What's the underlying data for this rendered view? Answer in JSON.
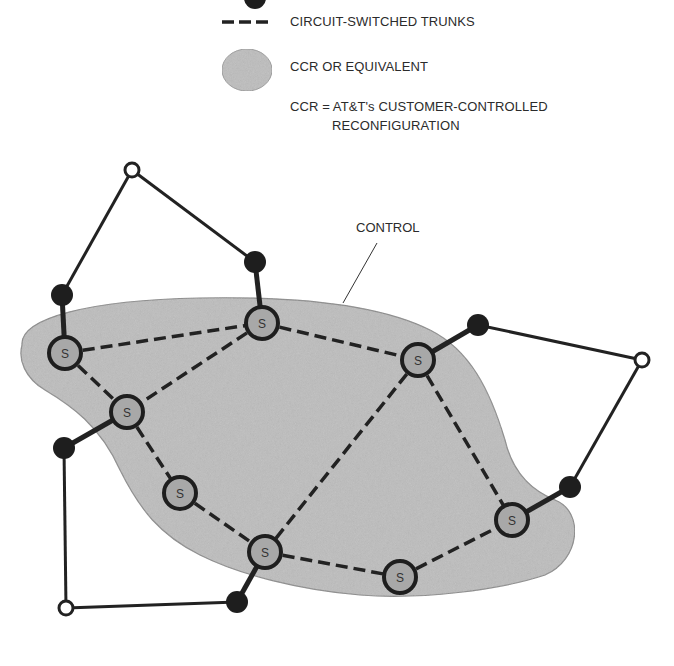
{
  "legend": {
    "items": [
      {
        "symbol": "black-node",
        "label": ""
      },
      {
        "symbol": "dashed-line",
        "label": "CIRCUIT-SWITCHED TRUNKS"
      },
      {
        "symbol": "gray-region",
        "label": "CCR OR EQUIVALENT"
      }
    ],
    "definition_line1": "CCR = AT&T's CUSTOMER-CONTROLLED",
    "definition_line2": "RECONFIGURATION"
  },
  "diagram": {
    "control_label": "CONTROL",
    "switch_label": "S",
    "colors": {
      "region_fill": "#bdbdbd",
      "region_stroke": "#8a8a8a",
      "switch_fill": "#a8a8a8",
      "line": "#222222",
      "black_node": "#1e1e1e",
      "open_node_fill": "#ffffff"
    },
    "switch_nodes": [
      {
        "id": "S1",
        "x": 65,
        "y": 353
      },
      {
        "id": "S2",
        "x": 262,
        "y": 323
      },
      {
        "id": "S3",
        "x": 418,
        "y": 360
      },
      {
        "id": "S4",
        "x": 127,
        "y": 412
      },
      {
        "id": "S5",
        "x": 180,
        "y": 493
      },
      {
        "id": "S6",
        "x": 265,
        "y": 552
      },
      {
        "id": "S7",
        "x": 400,
        "y": 577
      },
      {
        "id": "S8",
        "x": 512,
        "y": 520
      }
    ],
    "black_nodes": [
      {
        "id": "B1",
        "x": 62,
        "y": 295
      },
      {
        "id": "B2",
        "x": 255,
        "y": 262
      },
      {
        "id": "B3",
        "x": 478,
        "y": 325
      },
      {
        "id": "B4",
        "x": 64,
        "y": 448
      },
      {
        "id": "B5",
        "x": 570,
        "y": 487
      },
      {
        "id": "B6",
        "x": 237,
        "y": 602
      }
    ],
    "open_nodes": [
      {
        "id": "O1",
        "x": 132,
        "y": 170
      },
      {
        "id": "O2",
        "x": 642,
        "y": 360
      },
      {
        "id": "O3",
        "x": 66,
        "y": 608
      }
    ],
    "trunks": [
      [
        "S1",
        "S2"
      ],
      [
        "S1",
        "S4"
      ],
      [
        "S2",
        "S4"
      ],
      [
        "S2",
        "S3"
      ],
      [
        "S4",
        "S5"
      ],
      [
        "S5",
        "S6"
      ],
      [
        "S3",
        "S6"
      ],
      [
        "S3",
        "S8"
      ],
      [
        "S6",
        "S7"
      ],
      [
        "S7",
        "S8"
      ]
    ],
    "access_links": [
      [
        "B1",
        "S1"
      ],
      [
        "B2",
        "S2"
      ],
      [
        "B3",
        "S3"
      ],
      [
        "B4",
        "S4"
      ],
      [
        "B5",
        "S8"
      ],
      [
        "B6",
        "S6"
      ]
    ],
    "loop_links": [
      [
        "B1",
        "O1"
      ],
      [
        "O1",
        "B2"
      ],
      [
        "B3",
        "O2"
      ],
      [
        "O2",
        "B5"
      ],
      [
        "B4",
        "O3"
      ],
      [
        "O3",
        "B6"
      ]
    ]
  }
}
